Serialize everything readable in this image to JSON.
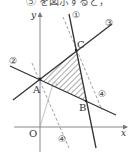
{
  "caption": "⑤ を図示すると，",
  "diagram": {
    "axes": {
      "x_label": "x",
      "y_label": "y",
      "origin_label": "O"
    },
    "points": [
      {
        "name": "A",
        "label": "A"
      },
      {
        "name": "B",
        "label": "B"
      },
      {
        "name": "C",
        "label": "C"
      }
    ],
    "lines": [
      {
        "id": "1",
        "label": "①",
        "style": "solid"
      },
      {
        "id": "2",
        "label": "②",
        "style": "solid"
      },
      {
        "id": "3",
        "label": "③",
        "style": "solid"
      },
      {
        "id": "4",
        "label": "④",
        "style": "dashed"
      }
    ],
    "shaded_region": "triangle ABC (hatched)",
    "colors": {
      "line": "#333333",
      "axis": "#888888",
      "hatch": "#555555"
    }
  }
}
